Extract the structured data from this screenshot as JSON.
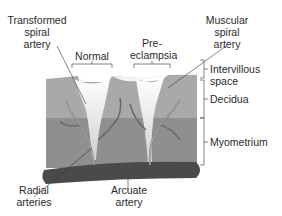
{
  "diagram": {
    "labels": {
      "transformed_artery": [
        "Transformed",
        "spiral",
        "artery"
      ],
      "muscular_artery": [
        "Muscular",
        "spiral",
        "artery"
      ],
      "normal": "Normal",
      "preeclampsia": [
        "Pre-",
        "eclampsia"
      ],
      "intervillous": [
        "Intervillous",
        "space"
      ],
      "decidua": "Decidua",
      "myometrium": "Myometrium",
      "radial": [
        "Radial",
        "arteries"
      ],
      "arcuate": [
        "Arcuate",
        "artery"
      ]
    },
    "colors": {
      "decidua": "#a9a9a9",
      "myometrium": "#8c8c8c",
      "arcuate": "#4a4a4a",
      "intervillous": "#f2f2f2",
      "vessel": "#d6d6d6",
      "line": "#333333"
    }
  }
}
